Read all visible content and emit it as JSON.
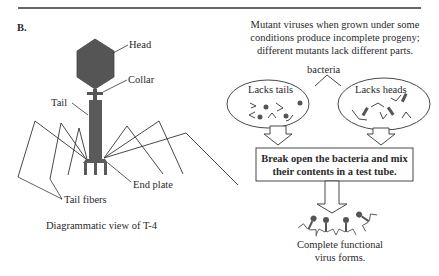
{
  "panel_label": "B.",
  "left": {
    "labels": {
      "head": "Head",
      "collar": "Collar",
      "tail": "Tail",
      "end_plate": "End plate",
      "tail_fibers": "Tail fibers"
    },
    "caption": "Diagrammatic view of T-4"
  },
  "right": {
    "intro_lines": [
      "Mutant viruses when grown under some",
      "conditions produce incomplete progeny;",
      "different mutants lack different parts."
    ],
    "bacteria_label": "bacteria",
    "oval_left_label": "Lacks tails",
    "oval_right_label": "Lacks heads",
    "box_lines": [
      "Break open the bacteria and mix",
      "their contents in a test tube."
    ],
    "result_lines": [
      "Complete functional",
      "virus forms."
    ]
  },
  "colors": {
    "ink": "#2a2a2a",
    "phage_fill": "#555555",
    "line": "#3a3a3a"
  }
}
